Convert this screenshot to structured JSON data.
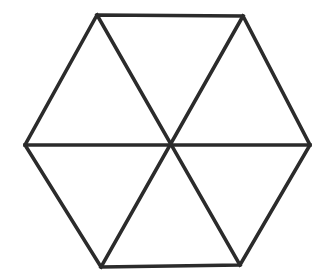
{
  "figure": {
    "name": "hexagon-divided-into-six-triangles",
    "title": "",
    "caption": "",
    "background_color": "#ffffff",
    "stroke_color": "#2b2b2b",
    "fill_color": "#ffffff",
    "stroke_width": 3.6,
    "canvas": {
      "width": 324,
      "height": 278
    }
  },
  "geometry": {
    "type": "polygon-with-diagonals",
    "shape": "hexagon",
    "vertex_count": 6,
    "region_count": 6,
    "diagonal_count": 3,
    "center": {
      "x": 168,
      "y": 145
    },
    "vertices": [
      {
        "id": "top-left",
        "x": 97,
        "y": 15
      },
      {
        "id": "top-right",
        "x": 243,
        "y": 16
      },
      {
        "id": "right",
        "x": 310,
        "y": 145
      },
      {
        "id": "bottom-right",
        "x": 240,
        "y": 265
      },
      {
        "id": "bottom-left",
        "x": 101,
        "y": 267
      },
      {
        "id": "left",
        "x": 25,
        "y": 145
      }
    ],
    "outline_points": "97,15 243,16 310,145 240,265 101,267 25,145",
    "diagonals": [
      {
        "id": "diagonal-top-left-to-bottom-right",
        "from": "top-left",
        "to": "bottom-right",
        "points": "97,15 240,265"
      },
      {
        "id": "diagonal-top-right-to-bottom-left",
        "from": "top-right",
        "to": "bottom-left",
        "points": "243,16 101,267"
      },
      {
        "id": "diagonal-left-to-right",
        "from": "left",
        "to": "right",
        "points": "25,145 310,145"
      }
    ],
    "triangles": [
      {
        "id": "triangle-top",
        "points": "97,15 243,16 168,145"
      },
      {
        "id": "triangle-upper-right",
        "points": "243,16 310,145 168,145"
      },
      {
        "id": "triangle-lower-right",
        "points": "310,145 240,265 168,145"
      },
      {
        "id": "triangle-bottom",
        "points": "240,265 101,267 168,145"
      },
      {
        "id": "triangle-lower-left",
        "points": "101,267 25,145 168,145"
      },
      {
        "id": "triangle-upper-left",
        "points": "25,145 97,15 168,145"
      }
    ]
  }
}
